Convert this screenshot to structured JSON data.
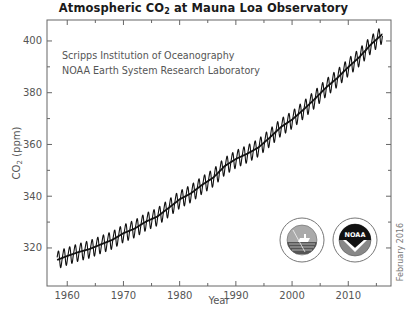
{
  "title": {
    "prefix": "Atmospheric CO",
    "subscript": "2",
    "suffix": " at Mauna Loa Observatory"
  },
  "credits": [
    "Scripps Institution of Oceanography",
    "NOAA Earth System Research Laboratory"
  ],
  "date_stamp": "February 2016",
  "logos": [
    {
      "name": "scripps-logo",
      "label": "Scripps"
    },
    {
      "name": "noaa-logo",
      "label": "NOAA"
    }
  ],
  "colors": {
    "line": "#111111",
    "axis": "#666666",
    "text": "#555555"
  },
  "chart_data": {
    "type": "line",
    "title": "Atmospheric CO2 at Mauna Loa Observatory",
    "xlabel": "Year",
    "ylabel": "CO2 (ppm)",
    "xlim": [
      1956.4,
      2017.6
    ],
    "ylim": [
      305.3,
      408.1
    ],
    "x_ticks": [
      1960,
      1970,
      1980,
      1990,
      2000,
      2010
    ],
    "x_minor_ticks": [
      1965,
      1975,
      1985,
      1995,
      2005,
      2015
    ],
    "y_ticks": [
      320,
      340,
      360,
      380,
      400
    ],
    "y_minor_ticks": [
      330,
      350,
      370,
      390
    ],
    "grid": false,
    "legend": "none",
    "seasonal_amplitude_ppm": 3.2,
    "series": [
      {
        "name": "Annual mean CO2 (ppm)",
        "x": [
          1958,
          1960,
          1962,
          1964,
          1966,
          1968,
          1970,
          1972,
          1974,
          1976,
          1978,
          1980,
          1982,
          1984,
          1986,
          1988,
          1990,
          1992,
          1994,
          1996,
          1998,
          2000,
          2002,
          2004,
          2006,
          2008,
          2010,
          2012,
          2014,
          2016
        ],
        "values": [
          315.2,
          316.9,
          318.4,
          319.6,
          321.4,
          323.1,
          325.7,
          327.5,
          330.2,
          332.1,
          335.4,
          338.8,
          341.1,
          344.4,
          347.2,
          351.6,
          354.4,
          356.4,
          358.8,
          362.6,
          366.7,
          369.6,
          373.4,
          377.5,
          381.9,
          385.6,
          389.9,
          393.8,
          398.6,
          402.5
        ]
      }
    ]
  }
}
